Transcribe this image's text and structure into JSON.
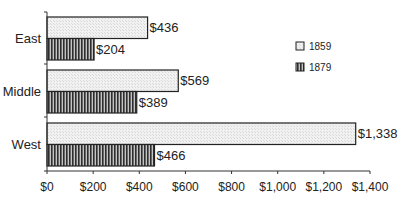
{
  "chart_data": {
    "type": "bar",
    "orientation": "horizontal",
    "title": "",
    "xlabel": "",
    "ylabel": "",
    "categories": [
      "East",
      "Middle",
      "West"
    ],
    "series": [
      {
        "name": "1859",
        "values": [
          436,
          569,
          1338
        ],
        "labels": [
          "$436",
          "$569",
          "$1,338"
        ],
        "pattern": "light-stipple"
      },
      {
        "name": "1879",
        "values": [
          204,
          389,
          466
        ],
        "labels": [
          "$204",
          "$389",
          "$466"
        ],
        "pattern": "vertical-stripes"
      }
    ],
    "xlim": [
      0,
      1400
    ],
    "xticks": [
      0,
      200,
      400,
      600,
      800,
      1000,
      1200,
      1400
    ],
    "xtick_labels": [
      "$0",
      "$200",
      "$400",
      "$600",
      "$800",
      "$1,000",
      "$1,200",
      "$1,400"
    ],
    "grid": false,
    "legend_position": "right"
  },
  "colors": {
    "bar_outline": "#222222",
    "light_fill": "#eeeeee",
    "stripe_dark": "#333333",
    "stripe_light": "#bbbbbb",
    "axis": "#333333"
  }
}
